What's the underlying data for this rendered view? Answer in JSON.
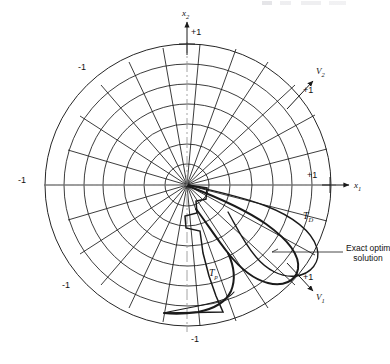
{
  "figure": {
    "type": "polar-phase-plane-diagram",
    "background": "#ffffff",
    "ink_color": "#1a1a1a",
    "axis_dash_color": "#9a9a9a",
    "center": {
      "x": 187,
      "y": 185
    },
    "unit_radius_px": 143
  },
  "axes": [
    {
      "name": "x1",
      "label": "x",
      "subscript": "1",
      "direction_deg": 0,
      "tick_label": "+1",
      "tick_at": "outer-ring",
      "arrow": true
    },
    {
      "name": "x2",
      "label": "x",
      "subscript": "2",
      "direction_deg": 90,
      "tick_label": "+1",
      "tick_at": "outer-ring",
      "arrow": true
    },
    {
      "name": "V2",
      "label": "V",
      "subscript": "2",
      "direction_deg": 40,
      "tick_label": "+1",
      "tick_at": "outer-ring",
      "arrow": true
    },
    {
      "name": "V1",
      "label": "V",
      "subscript": "1",
      "direction_deg": -40,
      "tick_label": "+1",
      "tick_at": "outer-ring",
      "arrow": true
    }
  ],
  "negative_tick_labels": [
    {
      "for_axis": "x1",
      "label": "-1",
      "position": "left"
    },
    {
      "for_axis": "x2",
      "label": "-1",
      "position": "bottom"
    },
    {
      "for_axis": "V1",
      "label": "-1",
      "position": "upper-left"
    },
    {
      "for_axis": "V2",
      "label": "-1",
      "position": "lower-left"
    }
  ],
  "grid": {
    "rings": 7,
    "spokes": 24,
    "ring_spacing": "equal",
    "style": "polar-mesh-slightly-skewed"
  },
  "curves": [
    {
      "name": "T_D",
      "label": "T",
      "subscript": "D",
      "style": "smooth-solid",
      "weight": "medium",
      "label_pos": {
        "x": 307,
        "y": 215
      }
    },
    {
      "name": "T_p",
      "label": "T",
      "subscript": "p",
      "style": "piecewise-linear-staircase",
      "weight": "medium",
      "label_pos": {
        "x": 213,
        "y": 272
      }
    },
    {
      "name": "exact_optimal",
      "label": "Exact optimal solution",
      "style": "smooth-solid",
      "weight": "heavy",
      "leader_line": true,
      "label_pos": {
        "x": 347,
        "y": 250
      }
    }
  ],
  "annotations": {
    "exact_optimal_line1": "Exact optimal",
    "exact_optimal_line2": "solution"
  },
  "tick_labels": {
    "plus_one": "+1",
    "minus_one": "-1"
  },
  "axis_text": {
    "x1": "x",
    "x1_sub": "1",
    "x2": "x",
    "x2_sub": "2",
    "v1": "V",
    "v1_sub": "1",
    "v2": "V",
    "v2_sub": "2",
    "td": "T",
    "td_sub": "D",
    "tp": "T",
    "tp_sub": "p"
  }
}
